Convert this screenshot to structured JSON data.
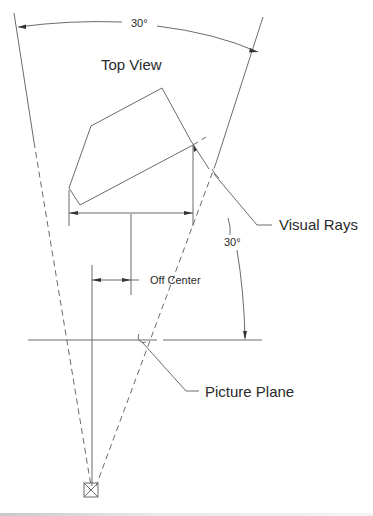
{
  "diagram": {
    "title": "Top View",
    "labels": {
      "top_angle": "30°",
      "side_angle": "30°",
      "visual_rays": "Visual Rays",
      "off_center": "Off Center",
      "picture_plane": "Picture Plane"
    },
    "colors": {
      "line": "#6b6b6b",
      "text": "#2a2a2a",
      "background": "#ffffff"
    },
    "elements": [
      "station-point",
      "left-visual-ray",
      "right-visual-ray",
      "cone-of-vision-arc",
      "object-top-view-polygon",
      "picture-plane-line",
      "center-line",
      "off-center-dimension",
      "object-width-dimension"
    ]
  }
}
